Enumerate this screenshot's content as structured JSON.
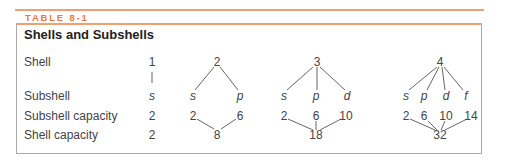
{
  "table_label": "TABLE 8-1",
  "title": "Shells and Subshells",
  "row_labels": {
    "shell": "Shell",
    "subshell": "Subshell",
    "subshell_capacity": "Subshell capacity",
    "shell_capacity": "Shell capacity"
  },
  "columns": [
    {
      "shell": "1",
      "subshells": [
        "s"
      ],
      "subshell_capacities": [
        "2"
      ],
      "shell_capacity": "2"
    },
    {
      "shell": "2",
      "subshells": [
        "s",
        "p"
      ],
      "subshell_capacities": [
        "2",
        "6"
      ],
      "shell_capacity": "8"
    },
    {
      "shell": "3",
      "subshells": [
        "s",
        "p",
        "d"
      ],
      "subshell_capacities": [
        "2",
        "6",
        "10"
      ],
      "shell_capacity": "18"
    },
    {
      "shell": "4",
      "subshells": [
        "s",
        "p",
        "d",
        "f"
      ],
      "subshell_capacities": [
        "2",
        "6",
        "10",
        "14"
      ],
      "shell_capacity": "32"
    }
  ],
  "colors": {
    "accent": "#e8793e",
    "rule": "#f0a070",
    "border": "#a8a8a8"
  }
}
